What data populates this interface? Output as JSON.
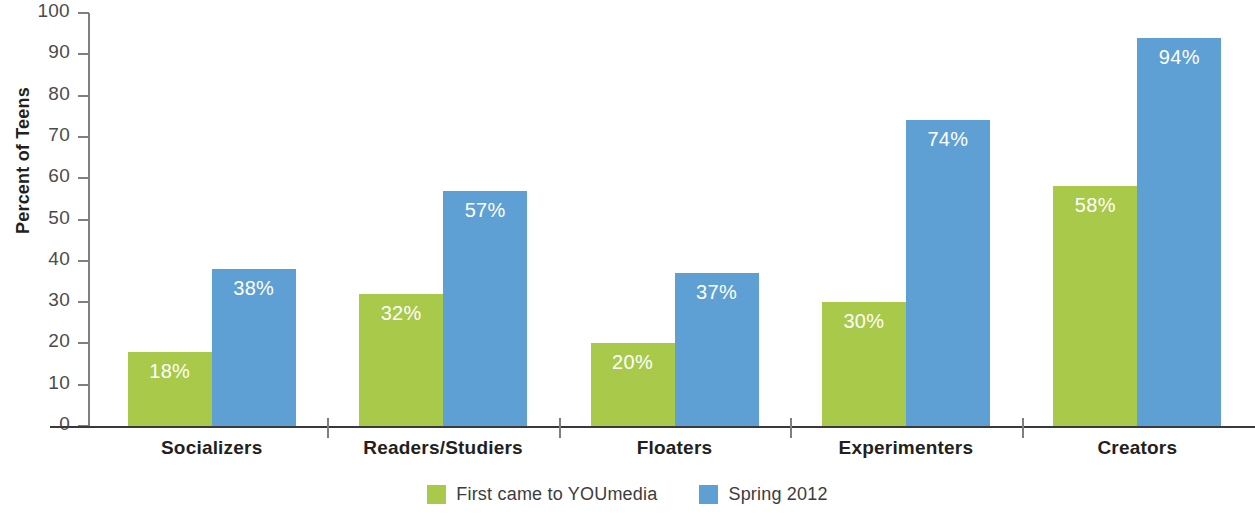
{
  "chart_data": {
    "type": "bar",
    "title": "",
    "subtitle": "",
    "xlabel": "",
    "ylabel": "Percent of Teens",
    "ylim": [
      0,
      100
    ],
    "ytick_step": 10,
    "ytick_labels": [
      "100",
      "90",
      "80",
      "70",
      "60",
      "50",
      "40",
      "30",
      "20",
      "10",
      "0"
    ],
    "grid": false,
    "legend_position": "bottom-center",
    "value_label_suffix": "%",
    "categories": [
      "Socializers",
      "Readers/Studiers",
      "Floaters",
      "Experimenters",
      "Creators"
    ],
    "series": [
      {
        "name": "First came to YOUmedia",
        "color": "#a8c949",
        "values": [
          18,
          32,
          20,
          30,
          58
        ],
        "labels": [
          "18%",
          "32%",
          "20%",
          "30%",
          "58%"
        ]
      },
      {
        "name": "Spring 2012",
        "color": "#5ea0d3",
        "values": [
          38,
          57,
          37,
          74,
          94
        ],
        "labels": [
          "38%",
          "57%",
          "37%",
          "74%",
          "94%"
        ]
      }
    ]
  },
  "colors": {
    "series_green": "#a8c949",
    "series_blue": "#5ea0d3",
    "axis_dark": "#3a3a3c",
    "axis_gray": "#7d7f81",
    "tick_text": "#4b4b4d",
    "label_text": "#231f20",
    "value_text": "#ffffff",
    "background": "#ffffff"
  },
  "legend": {
    "items": [
      {
        "label": "First came to YOUmedia",
        "swatch_name": "legend-swatch-green"
      },
      {
        "label": "Spring 2012",
        "swatch_name": "legend-swatch-blue"
      }
    ]
  }
}
